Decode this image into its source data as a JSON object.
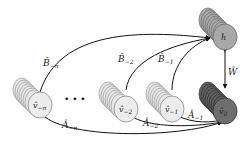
{
  "diagram": {
    "nodes": {
      "h": {
        "label": "ĥ",
        "color": "#a8a8a8",
        "edge_color": "#7a7a7a"
      },
      "v0": {
        "label": "v̂",
        "sub": "0",
        "color": "#5e5e5e",
        "edge_color": "#3e3e3e"
      },
      "v_minus_1": {
        "label": "v̂",
        "sub": "−1",
        "color": "#e6e6e6",
        "edge_color": "#b8b8b8"
      },
      "v_minus_2": {
        "label": "v̂",
        "sub": "−2",
        "color": "#e6e6e6",
        "edge_color": "#b8b8b8"
      },
      "v_minus_n": {
        "label": "v̂",
        "sub": "−n",
        "color": "#e6e6e6",
        "edge_color": "#b8b8b8"
      }
    },
    "ellipsis": "• • •",
    "edges": {
      "B_minus_n": {
        "label": "B̂",
        "sub": "−n"
      },
      "B_minus_2": {
        "label": "B̂",
        "sub": "−2"
      },
      "B_minus_1": {
        "label": "B̂",
        "sub": "−1"
      },
      "A_minus_n": {
        "label": "Â",
        "sub": "−n"
      },
      "A_minus_2": {
        "label": "Â",
        "sub": "−2"
      },
      "A_minus_1": {
        "label": "Â",
        "sub": "−1"
      },
      "W": {
        "label": "Ŵ"
      }
    }
  }
}
